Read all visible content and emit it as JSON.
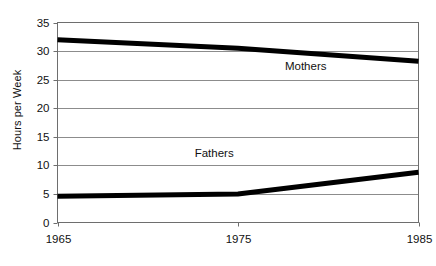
{
  "chart_data": {
    "type": "line",
    "title": "",
    "subtitle": "",
    "xlabel": "",
    "ylabel": "Hours per Week",
    "x": [
      1965,
      1975,
      1985
    ],
    "categories": [
      "1965",
      "1975",
      "1985"
    ],
    "xlim": [
      1965,
      1985
    ],
    "ylim": [
      0,
      35
    ],
    "yticks": [
      0,
      5,
      10,
      15,
      20,
      25,
      30,
      35
    ],
    "ytick_labels": [
      "0",
      "5",
      "10",
      "15",
      "20",
      "25",
      "30",
      "35"
    ],
    "xticks": [
      1965,
      1975,
      1985
    ],
    "xtick_labels": [
      "1965",
      "1975",
      "1985"
    ],
    "grid": "horizontal",
    "legend": "inline-labels",
    "series": [
      {
        "name": "Mothers",
        "values": [
          32.0,
          30.5,
          28.2
        ],
        "color": "#000000",
        "label_position": "inline-right"
      },
      {
        "name": "Fathers",
        "values": [
          4.6,
          5.0,
          8.8
        ],
        "color": "#000000",
        "label_position": "inline-above"
      }
    ],
    "annotations": [
      {
        "text": "Mothers",
        "x": 1977.6,
        "y": 27.3
      },
      {
        "text": "Fathers",
        "x": 1972.6,
        "y": 12.0
      }
    ],
    "colors": {
      "line": "#000000",
      "gridline": "#8c8c8c",
      "axis": "#6e6e6e",
      "text": "#111111",
      "background": "#ffffff"
    }
  }
}
